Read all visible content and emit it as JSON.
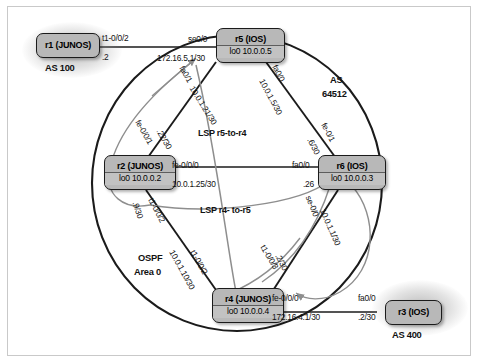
{
  "diagram": {
    "domain_label_as": "AS",
    "colors": {
      "node_fill": "#b8b8b8",
      "node_border": "#1b1b1b",
      "link_dark": "#1b1b1b",
      "link_gray": "#8e8e8e",
      "frame": "#c9c9c9",
      "background": "#ffffff"
    }
  },
  "nodes": [
    {
      "id": "r1",
      "name": "r1 (JUNOS)",
      "loopback": "",
      "as": "AS 100",
      "type": "edge"
    },
    {
      "id": "r2",
      "name": "r2 (JUNOS)",
      "loopback": "lo0 10.0.0.2",
      "as": "",
      "type": "core"
    },
    {
      "id": "r3",
      "name": "r3 (IOS)",
      "loopback": "",
      "as": "AS 400",
      "type": "edge"
    },
    {
      "id": "r4",
      "name": "r4 (JUNOS)",
      "loopback": "lo0 10.0.0.4",
      "as": "",
      "type": "core"
    },
    {
      "id": "r5",
      "name": "r5 (IOS)",
      "loopback": "lo0 10.0.0.5",
      "as": "",
      "type": "core"
    },
    {
      "id": "r6",
      "name": "r6 (IOS)",
      "loopback": "lo0 10.0.0.3",
      "as": "",
      "type": "core"
    }
  ],
  "area_labels": {
    "as_number_line1": "AS",
    "as_number_line2": "64512",
    "ospf_line1": "OSPF",
    "ospf_line2": "Area 0",
    "as100": "AS 100",
    "as400": "AS 400"
  },
  "lsp_labels": [
    {
      "id": "lsp-r5-to-r4",
      "text": "LSP r5-to-r4"
    },
    {
      "id": "lsp-r4-to-r5",
      "text": "LSP r4- to-r5"
    }
  ],
  "interface_labels": [
    {
      "id": "r1-t1-0-0-2",
      "text": "t1-0/0/2"
    },
    {
      "id": "r1-addr",
      "text": ".2"
    },
    {
      "id": "r5-se0-0",
      "text": "se0/0"
    },
    {
      "id": "r5-se0-0-addr",
      "text": "172.16.5.1/30"
    },
    {
      "id": "r2-fa0-1",
      "text": "fa0/1"
    },
    {
      "id": "r5-10-0-1-21",
      "text": "10.0.1.21/30"
    },
    {
      "id": "r2-fe-0-0-1",
      "text": "fe-0/0/1"
    },
    {
      "id": "r2-22-30",
      "text": ".22/30"
    },
    {
      "id": "r5-fa0-0",
      "text": "fa0/0"
    },
    {
      "id": "r5-10-0-1-5",
      "text": "10.0.1.5/30"
    },
    {
      "id": "r6-fe-0-1",
      "text": "fe-0/1"
    },
    {
      "id": "r6-6-30",
      "text": ".6/30"
    },
    {
      "id": "r2-fe-0-0-0",
      "text": "fe-0/0/0"
    },
    {
      "id": "r2-10-0-1-25",
      "text": "10.0.1.25/30"
    },
    {
      "id": "r6-fa0-0",
      "text": "fa0/0"
    },
    {
      "id": "r6-26",
      "text": ".26"
    },
    {
      "id": "r2-9-30",
      "text": ".9/30"
    },
    {
      "id": "r2-t1-0-0-2",
      "text": "t1-0/0/2"
    },
    {
      "id": "r4-10-0-1-10",
      "text": "10.0.1.10/30"
    },
    {
      "id": "r4-t1-0-0-2",
      "text": "t1-0/0/2"
    },
    {
      "id": "r6-se-0-0",
      "text": "se-0/0"
    },
    {
      "id": "r6-10-0-1-1",
      "text": "10.0.1.1/30"
    },
    {
      "id": "r4-t1-0-0-3",
      "text": "t1-0/0/3"
    },
    {
      "id": "r4-2-30",
      "text": ".2/30"
    },
    {
      "id": "r4-fe-0-0-0",
      "text": "fe-0/0/0"
    },
    {
      "id": "r4-172-16-4-1",
      "text": "172.16.4.1/30"
    },
    {
      "id": "r3-fa0-0",
      "text": "fa0/0"
    },
    {
      "id": "r3-2-30",
      "text": ".2/30"
    }
  ]
}
